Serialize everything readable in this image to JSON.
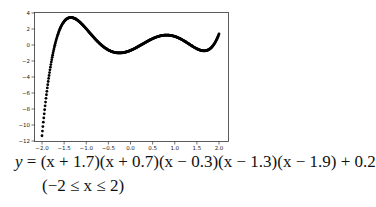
{
  "chart_data": {
    "type": "scatter",
    "title": "",
    "xlabel": "",
    "ylabel": "",
    "xlim": [
      -2.1,
      2.1
    ],
    "ylim": [
      -12,
      4
    ],
    "grid": false,
    "legend": null,
    "x_ticks": [
      "-2.0",
      "-1.5",
      "-1.0",
      "-0.5",
      "0.0",
      "0.5",
      "1.0",
      "1.5",
      "2.0"
    ],
    "y_ticks": [
      "4",
      "2",
      "0",
      "-2",
      "-4",
      "-6",
      "-8",
      "-10",
      "-12"
    ],
    "function": "y = (x+1.7)(x+0.7)(x-0.3)(x-1.3)(x-1.9)+0.2",
    "domain": [
      -2,
      2
    ],
    "marker_color": "#000000",
    "series": [
      {
        "name": "f(x)",
        "x": [
          -2.0,
          -1.9,
          -1.8,
          -1.7,
          -1.6,
          -1.5,
          -1.4,
          -1.3,
          -1.2,
          -1.1,
          -1.0,
          -0.9,
          -0.8,
          -0.7,
          -0.6,
          -0.5,
          -0.4,
          -0.3,
          -0.2,
          -0.1,
          0.0,
          0.1,
          0.2,
          0.3,
          0.4,
          0.5,
          0.6,
          0.7,
          0.8,
          0.9,
          1.0,
          1.1,
          1.2,
          1.3,
          1.4,
          1.5,
          1.6,
          1.7,
          1.8,
          1.9,
          2.0
        ],
        "y": [
          -11.3,
          -6.2,
          -2.4,
          0.2,
          1.9,
          2.9,
          3.3,
          3.3,
          3.0,
          2.5,
          1.9,
          1.3,
          0.7,
          0.2,
          -0.3,
          -0.6,
          -0.8,
          -0.9,
          -0.9,
          -0.8,
          -0.6,
          -0.4,
          -0.1,
          0.2,
          0.4,
          0.7,
          0.9,
          1.0,
          1.1,
          1.2,
          1.1,
          1.0,
          0.8,
          0.6,
          0.3,
          0.0,
          -0.3,
          -0.5,
          -0.6,
          -0.2,
          1.2
        ]
      }
    ]
  },
  "equation": {
    "line1_lhs": "y",
    "line1_rhs": "= (x + 1.7)(x + 0.7)(x − 0.3)(x − 1.3)(x − 1.9) + 0.2",
    "line2": "(−2 ≤ x ≤ 2)"
  }
}
